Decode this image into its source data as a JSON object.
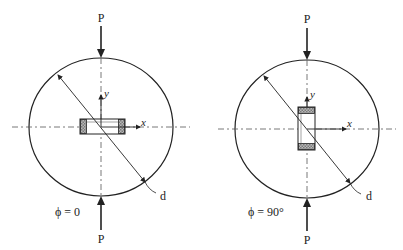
{
  "figures": [
    {
      "id": "phi0",
      "load_top_label": "P",
      "load_bottom_label": "P",
      "x_axis_label": "x",
      "y_axis_label": "y",
      "diameter_label": "d",
      "angle_label": "ϕ = 0"
    },
    {
      "id": "phi90",
      "load_top_label": "P",
      "load_bottom_label": "P",
      "x_axis_label": "x",
      "y_axis_label": "y",
      "diameter_label": "d",
      "angle_label": "ϕ = 90°"
    }
  ],
  "colors": {
    "stroke": "#222222",
    "dash": "#555555",
    "hatch": "#9a9a9a"
  }
}
